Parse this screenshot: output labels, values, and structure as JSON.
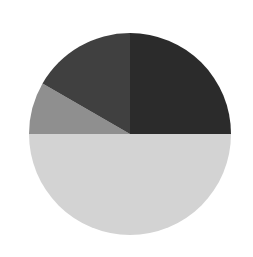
{
  "background": "#ffffff",
  "chart_data": {
    "type": "pie",
    "title": "",
    "start_angle_deg": 0,
    "direction": "clockwise",
    "center": [
      130,
      134
    ],
    "radius": 101,
    "categories": [
      "Slice A",
      "Slice B",
      "Slice C",
      "Slice D"
    ],
    "values": [
      25.0,
      50.0,
      8.33,
      16.67
    ],
    "colors": [
      "#2b2b2b",
      "#d3d3d3",
      "#8f8f8f",
      "#404040"
    ],
    "legend": "none",
    "labels_shown": false
  }
}
